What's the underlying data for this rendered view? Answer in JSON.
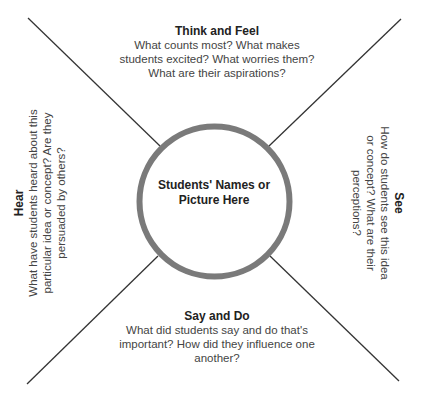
{
  "diagram": {
    "type": "empathy-map",
    "center": {
      "label": "Students' Names or Picture Here"
    },
    "quadrants": {
      "top": {
        "title": "Think and Feel",
        "body": "What counts most? What makes students excited? What worries them? What are their aspirations?"
      },
      "right": {
        "title": "See",
        "body": "How do students see this idea or concept? What are their perceptions?"
      },
      "bottom": {
        "title": "Say and Do",
        "body": "What did students say and do that's important? How did they influence one another?"
      },
      "left": {
        "title": "Hear",
        "body": "What have students heard about this particular idea or concept? Are they persuaded by others?"
      }
    },
    "colors": {
      "circle_stroke": "#7a7a7a",
      "divider_lines": "#333333",
      "background": "#ffffff"
    }
  }
}
